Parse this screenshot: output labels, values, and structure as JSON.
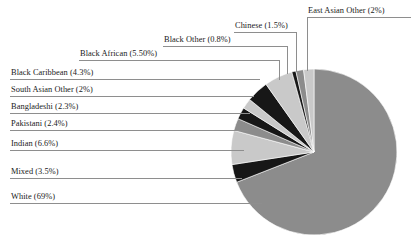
{
  "chart_data": {
    "type": "pie",
    "title": "",
    "xlabel": "",
    "ylabel": "",
    "legend_position": "callout-labels",
    "grid": false,
    "categories": [
      "White",
      "Mixed",
      "Indian",
      "Pakistani",
      "Bangladeshi",
      "South Asian Other",
      "Black Caribbean",
      "Black African",
      "Black Other",
      "Chinese",
      "East Asian Other"
    ],
    "values": [
      69,
      3.5,
      6.6,
      2.4,
      2.3,
      2,
      4.3,
      5.5,
      0.8,
      1.5,
      2
    ],
    "value_labels": [
      "69%",
      "3.5%",
      "6.6%",
      "2.4%",
      "2.3%",
      "2%",
      "4.3%",
      "5.50%",
      "0.8%",
      "1.5%",
      "2%"
    ],
    "slice_colors": [
      "#8c8c8c",
      "#171717",
      "#c9c9c9",
      "#8c8c8c",
      "#171717",
      "#c9c9c9",
      "#8c8c8c",
      "#171717",
      "#c9c9c9",
      "#8c8c8c",
      "#171717",
      "#c9c9c9"
    ],
    "annotations": [
      "White (69%)",
      "Mixed (3.5%)",
      "Indian (6.6%)",
      "Pakistani (2.4%)",
      "Bangladeshi (2.3%)",
      "South Asian Other (2%)",
      "Black Caribbean (4.3%)",
      "Black African (5.50%)",
      "Black Other (0.8%)",
      "Chinese (1.5%)",
      "East Asian Other (2%)"
    ]
  },
  "labels": {
    "east_asian_other": "East Asian Other (2%)",
    "chinese": "Chinese (1.5%)",
    "black_other": "Black Other (0.8%)",
    "black_african": "Black African (5.50%)",
    "black_caribbean": "Black Caribbean (4.3%)",
    "south_asian_other": "South Asian Other (2%)",
    "bangladeshi": "Bangladeshi (2.3%)",
    "pakistani": "Pakistani (2.4%)",
    "indian": "Indian (6.6%)",
    "mixed": "Mixed (3.5%)",
    "white": "White (69%)"
  },
  "colors": {
    "light_gray": "#c9c9c9",
    "mid_gray": "#8c8c8c",
    "black": "#171717",
    "leader_line": "#8e8e8e",
    "text": "#1a1a1a",
    "background": "#ffffff"
  }
}
